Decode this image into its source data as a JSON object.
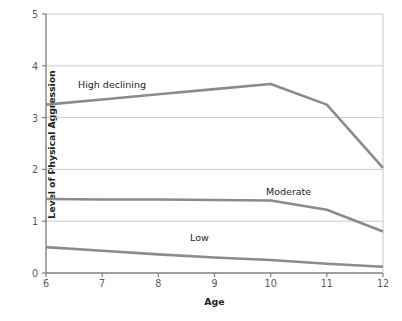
{
  "chart_data": {
    "type": "line",
    "title": "",
    "xlabel": "Age",
    "ylabel": "Level of Physical Aggression",
    "x": [
      6,
      7,
      8,
      9,
      10,
      11,
      12
    ],
    "xlim": [
      6,
      12
    ],
    "ylim": [
      0,
      5
    ],
    "x_ticks": [
      "6",
      "7",
      "8",
      "9",
      "10",
      "11",
      "12"
    ],
    "y_ticks": [
      "0",
      "1",
      "2",
      "3",
      "4",
      "5"
    ],
    "grid": "horizontal",
    "legend": "inline-labels",
    "series": [
      {
        "name": "High declining",
        "label": "High declining",
        "color": "#8b8b8b",
        "values": [
          3.25,
          3.35,
          3.45,
          3.55,
          3.65,
          3.25,
          2.03
        ],
        "label_x": 78,
        "label_y": 79
      },
      {
        "name": "Moderate",
        "label": "Moderate",
        "color": "#8b8b8b",
        "values": [
          1.43,
          1.42,
          1.42,
          1.41,
          1.4,
          1.22,
          0.8
        ],
        "label_x": 266,
        "label_y": 186
      },
      {
        "name": "Low",
        "label": "Low",
        "color": "#8b8b8b",
        "values": [
          0.5,
          0.43,
          0.36,
          0.3,
          0.25,
          0.18,
          0.12
        ],
        "label_x": 190,
        "label_y": 232
      }
    ]
  },
  "colors": {
    "line": "#8b8b8b",
    "grid": "#c9c9c9",
    "axis": "#808080",
    "text": "#231f20",
    "tick_text": "#58595b",
    "background": "#ffffff"
  }
}
